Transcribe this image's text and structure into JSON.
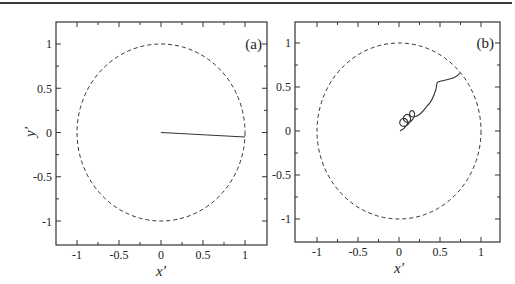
{
  "chart_data": [
    {
      "type": "line",
      "panel_label": "(a)",
      "xlabel": "x′",
      "ylabel": "y′",
      "xlim": [
        -1.25,
        1.25
      ],
      "ylim": [
        -1.25,
        1.25
      ],
      "xticks": [
        -1,
        -0.5,
        0,
        0.5,
        1
      ],
      "xtick_labels": [
        "-1",
        "-0.5",
        "0",
        "0.5",
        "1"
      ],
      "yticks": [
        -1,
        -0.5,
        0,
        0.5,
        1
      ],
      "ytick_labels": [
        "-1",
        "-0.5",
        "0",
        "0.5",
        "1"
      ],
      "grid": false,
      "series": [
        {
          "name": "unit circle",
          "style": "dashed",
          "shape": "circle",
          "center": [
            0,
            0
          ],
          "radius": 1
        },
        {
          "name": "trajectory",
          "style": "solid",
          "x": [
            0,
            1.0
          ],
          "y": [
            0,
            -0.05
          ]
        }
      ]
    },
    {
      "type": "line",
      "panel_label": "(b)",
      "xlabel": "x′",
      "ylabel": "",
      "xlim": [
        -1.25,
        1.25
      ],
      "ylim": [
        -1.25,
        1.25
      ],
      "xticks": [
        -1,
        -0.5,
        0,
        0.5,
        1
      ],
      "xtick_labels": [
        "-1",
        "-0.5",
        "0",
        "0.5",
        "1"
      ],
      "yticks": [
        -1,
        -0.5,
        0,
        0.5,
        1
      ],
      "ytick_labels": [
        "-1",
        "-0.5",
        "0",
        "0.5",
        "1"
      ],
      "grid": false,
      "series": [
        {
          "name": "unit circle",
          "style": "dashed",
          "shape": "circle",
          "center": [
            0,
            0
          ],
          "radius": 1
        },
        {
          "name": "trajectory",
          "style": "solid",
          "x": [
            0.0,
            0.05,
            0.12,
            0.05,
            0.0,
            0.1,
            0.18,
            0.1,
            0.06,
            0.17,
            0.26,
            0.22,
            0.16,
            0.3,
            0.38,
            0.42,
            0.44,
            0.46,
            0.56,
            0.66,
            0.74
          ],
          "y": [
            0.0,
            0.03,
            0.12,
            0.18,
            0.1,
            0.08,
            0.18,
            0.24,
            0.16,
            0.14,
            0.24,
            0.3,
            0.22,
            0.2,
            0.27,
            0.36,
            0.48,
            0.56,
            0.58,
            0.6,
            0.66
          ]
        }
      ]
    }
  ],
  "panels": {
    "a": {
      "label": "(a)",
      "xlabel": "x′",
      "ylabel": "y′"
    },
    "b": {
      "label": "(b)",
      "xlabel": "x′"
    }
  },
  "ticks": [
    "-1",
    "-0.5",
    "0",
    "0.5",
    "1"
  ]
}
